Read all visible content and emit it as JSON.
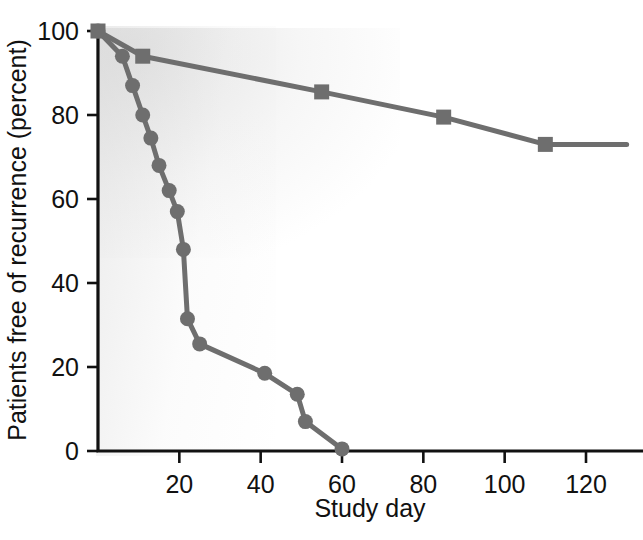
{
  "chart_data": {
    "type": "line",
    "title": "",
    "xlabel": "Study day",
    "ylabel": "Patients free of recurrence (percent)",
    "xlim": [
      0,
      130
    ],
    "ylim": [
      0,
      100
    ],
    "xticks": [
      20,
      40,
      60,
      80,
      100,
      120
    ],
    "yticks": [
      0,
      20,
      40,
      60,
      80,
      100
    ],
    "xtick_labels": [
      "20",
      "40",
      "60",
      "80",
      "100",
      "120"
    ],
    "ytick_labels": [
      "0",
      "20",
      "40",
      "60",
      "80",
      "100"
    ],
    "grid": false,
    "legend": "none",
    "marker_color": "#6e6e6e",
    "line_color": "#6e6e6e",
    "axis_color": "#111111",
    "background_color": "#ffffff",
    "series": [
      {
        "name": "square-series",
        "marker": "square",
        "color": "#6e6e6e",
        "points": [
          {
            "x": 0,
            "y": 100
          },
          {
            "x": 11,
            "y": 94
          },
          {
            "x": 55,
            "y": 85.5
          },
          {
            "x": 85,
            "y": 79.5
          },
          {
            "x": 110,
            "y": 73
          },
          {
            "x": 130,
            "y": 73
          }
        ]
      },
      {
        "name": "circle-series",
        "marker": "circle",
        "color": "#6e6e6e",
        "points": [
          {
            "x": 0,
            "y": 100
          },
          {
            "x": 6,
            "y": 94
          },
          {
            "x": 8.5,
            "y": 87
          },
          {
            "x": 11,
            "y": 80
          },
          {
            "x": 13,
            "y": 74.5
          },
          {
            "x": 15,
            "y": 68
          },
          {
            "x": 17.5,
            "y": 62
          },
          {
            "x": 19.5,
            "y": 57
          },
          {
            "x": 21,
            "y": 48
          },
          {
            "x": 22,
            "y": 31.5
          },
          {
            "x": 25,
            "y": 25.5
          },
          {
            "x": 41,
            "y": 18.5
          },
          {
            "x": 49,
            "y": 13.5
          },
          {
            "x": 51,
            "y": 7
          },
          {
            "x": 60,
            "y": 0.5
          }
        ]
      }
    ]
  },
  "axes": {
    "x_title": "Study day",
    "y_title": "Patients free of recurrence (percent)"
  }
}
